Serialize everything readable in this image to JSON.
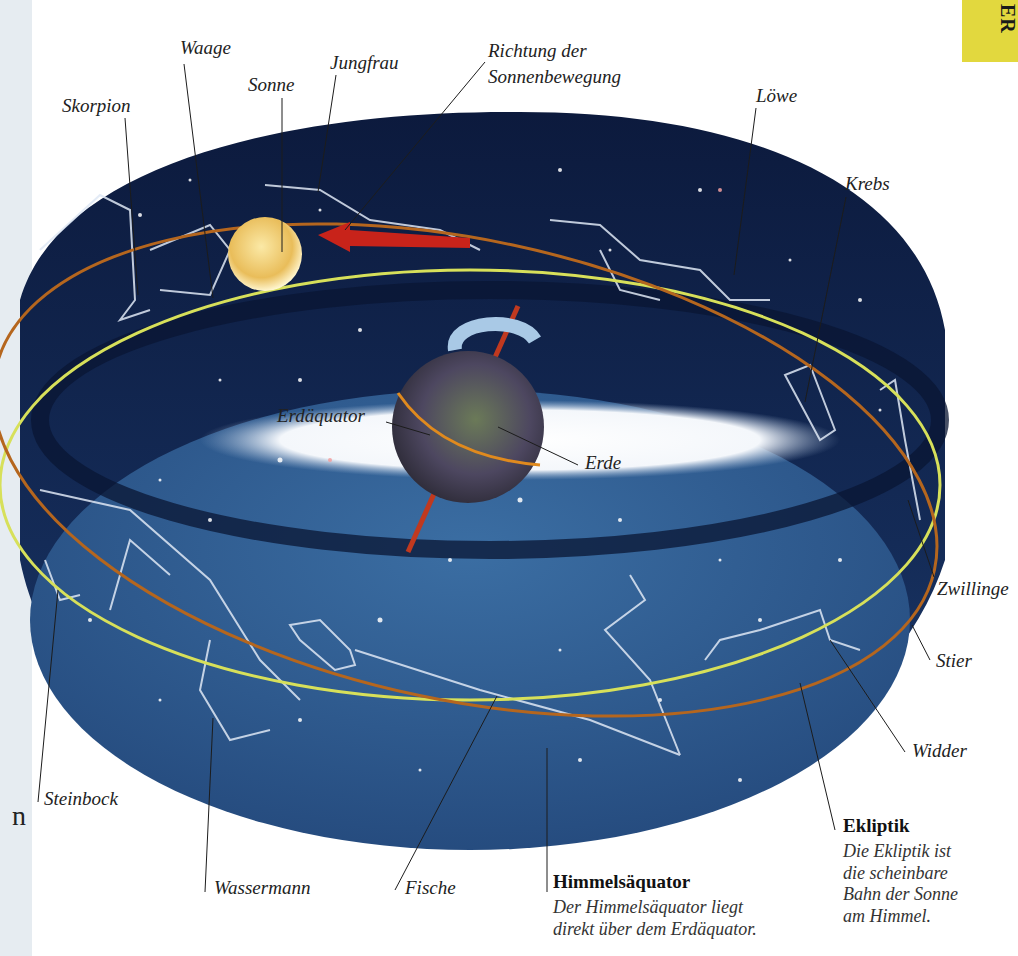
{
  "page": {
    "tab_text": "ER",
    "partial_left_text": "n",
    "colors": {
      "sky_dark": "#0e1f45",
      "sky_floor": "#2f5a8c",
      "ecliptic": "#d7e05a",
      "celestial_equator": "#b5661e",
      "sun": "#f2d27a",
      "arrow": "#c8231a",
      "tab": "#e2d83e"
    }
  },
  "labels": {
    "skorpion": "Skorpion",
    "waage": "Waage",
    "sonne": "Sonne",
    "jungfrau": "Jungfrau",
    "richtung_line1": "Richtung der",
    "richtung_line2": "Sonnenbewegung",
    "loewe": "Löwe",
    "krebs": "Krebs",
    "erdaequator": "Erdäquator",
    "erde": "Erde",
    "zwillinge": "Zwillinge",
    "stier": "Stier",
    "widder": "Widder",
    "steinbock": "Steinbock",
    "wassermann": "Wassermann",
    "fische": "Fische"
  },
  "captions": {
    "himmelsaequator": {
      "title": "Himmelsäquator",
      "line1": "Der Himmelsäquator liegt",
      "line2": "direkt über dem Erdäquator."
    },
    "ekliptik": {
      "title": "Ekliptik",
      "line1": "Die Ekliptik ist",
      "line2": "die scheinbare",
      "line3": "Bahn der Sonne",
      "line4": "am Himmel."
    }
  }
}
